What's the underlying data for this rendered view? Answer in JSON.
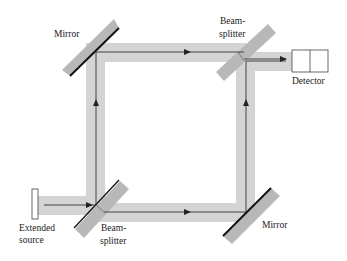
{
  "diagram": {
    "type": "Mach-Zehnder interferometer",
    "colors": {
      "beam_band": "#d4d4d4",
      "beam_line": "#333333",
      "optic_fill": "#b8b8b8",
      "mirror_edge": "#111111",
      "detector_fill": "#ffffff",
      "detector_stroke": "#444444"
    },
    "labels": {
      "mirror_top": "Mirror",
      "beamsplitter_top_line1": "Beam-",
      "beamsplitter_top_line2": "splitter",
      "detector": "Detector",
      "source_line1": "Extended",
      "source_line2": "source",
      "beamsplitter_bottom_line1": "Beam-",
      "beamsplitter_bottom_line2": "splitter",
      "mirror_bottom": "Mirror"
    },
    "components": [
      {
        "id": "extended-source",
        "kind": "source"
      },
      {
        "id": "beamsplitter-bottom-left",
        "kind": "beamsplitter"
      },
      {
        "id": "mirror-top-left",
        "kind": "mirror"
      },
      {
        "id": "mirror-bottom-right",
        "kind": "mirror"
      },
      {
        "id": "beamsplitter-top-right",
        "kind": "beamsplitter"
      },
      {
        "id": "detector",
        "kind": "detector"
      }
    ]
  }
}
